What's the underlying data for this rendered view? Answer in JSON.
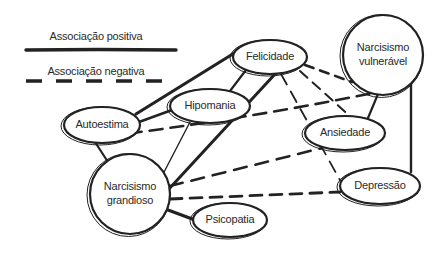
{
  "legend": {
    "positive_label": "Associação positiva",
    "negative_label": "Associação negativa"
  },
  "colors": {
    "ink": "#222222",
    "background": "#ffffff"
  },
  "nodes": {
    "felicidade": {
      "lines": [
        "Felicidade"
      ]
    },
    "narcisismo_vulneravel": {
      "lines": [
        "Narcisismo",
        "vulnerável"
      ]
    },
    "hipomania": {
      "lines": [
        "Hipomania"
      ]
    },
    "autoestima": {
      "lines": [
        "Autoestima"
      ]
    },
    "ansiedade": {
      "lines": [
        "Ansiedade"
      ]
    },
    "narcisismo_grandioso": {
      "lines": [
        "Narcisismo",
        "grandioso"
      ]
    },
    "depressao": {
      "lines": [
        "Depressão"
      ]
    },
    "psicopatia": {
      "lines": [
        "Psicopatia"
      ]
    }
  },
  "edges": [
    {
      "from": "autoestima",
      "to": "felicidade",
      "type": "positive"
    },
    {
      "from": "autoestima",
      "to": "hipomania",
      "type": "positive"
    },
    {
      "from": "autoestima",
      "to": "narcisismo_grandioso",
      "type": "positive"
    },
    {
      "from": "hipomania",
      "to": "felicidade",
      "type": "positive"
    },
    {
      "from": "hipomania",
      "to": "narcisismo_grandioso",
      "type": "positive"
    },
    {
      "from": "felicidade",
      "to": "narcisismo_grandioso",
      "type": "positive"
    },
    {
      "from": "narcisismo_grandioso",
      "to": "psicopatia",
      "type": "positive"
    },
    {
      "from": "narcisismo_vulneravel",
      "to": "ansiedade",
      "type": "positive"
    },
    {
      "from": "narcisismo_vulneravel",
      "to": "depressao",
      "type": "positive"
    },
    {
      "from": "felicidade",
      "to": "narcisismo_vulneravel",
      "type": "negative"
    },
    {
      "from": "felicidade",
      "to": "ansiedade",
      "type": "negative"
    },
    {
      "from": "felicidade",
      "to": "depressao",
      "type": "negative"
    },
    {
      "from": "autoestima",
      "to": "narcisismo_vulneravel",
      "type": "negative"
    },
    {
      "from": "narcisismo_grandioso",
      "to": "ansiedade",
      "type": "negative"
    },
    {
      "from": "narcisismo_grandioso",
      "to": "depressao",
      "type": "negative"
    }
  ]
}
